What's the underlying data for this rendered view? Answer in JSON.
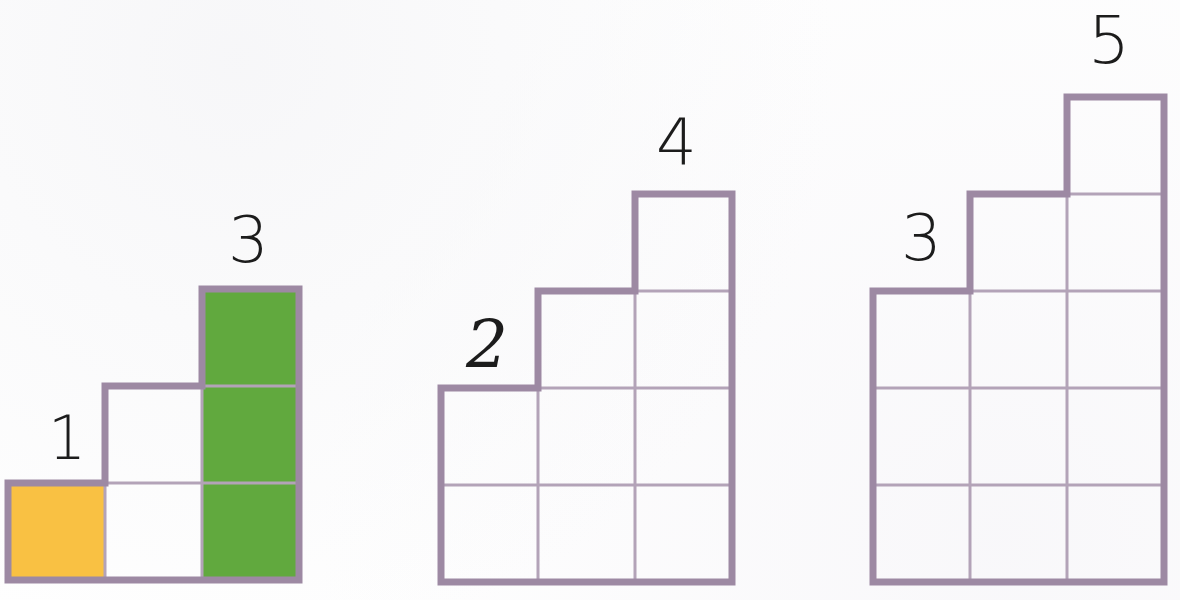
{
  "page": {
    "width": 1180,
    "height": 600,
    "background_color": "#fefefe"
  },
  "style": {
    "grid_line_color": "#a18fa6",
    "grid_outer_line_color": "#9d89a3",
    "grid_inner_line_color": "#b3a3b8",
    "fill_green": "#61a93e",
    "fill_orange": "#f9c143",
    "fill_white": "#ffffff",
    "label_color": "#1c1c1c",
    "cell_size_px": 97,
    "outer_stroke_px": 7,
    "inner_stroke_px": 3
  },
  "chart_data": {
    "type": "bar",
    "xlabel": "",
    "ylabel": "Number of squares in column",
    "ylim": [
      0,
      5
    ],
    "grid": true,
    "legend": "none",
    "note": "Three staircase patterns drawn as unit-square grids; each labelled column shows its height in squares.",
    "series": [
      {
        "name": "Figure 1",
        "categories": [
          "col-1",
          "col-2",
          "col-3"
        ],
        "values": [
          1,
          2,
          3
        ],
        "labels": [
          "1",
          "",
          "3"
        ],
        "total_squares": 6
      },
      {
        "name": "Figure 2",
        "categories": [
          "col-1",
          "col-2",
          "col-3"
        ],
        "values": [
          2,
          3,
          4
        ],
        "labels": [
          "2",
          "",
          "4"
        ],
        "total_squares": 9
      },
      {
        "name": "Figure 3",
        "categories": [
          "col-1",
          "col-2",
          "col-3"
        ],
        "values": [
          3,
          4,
          5
        ],
        "labels": [
          "3",
          "",
          "5"
        ],
        "total_squares": 12
      }
    ]
  },
  "figures": [
    {
      "id": "figure-1",
      "columns": [
        1,
        2,
        3
      ],
      "origin_x": 8,
      "baseline_y": 580,
      "labels": [
        {
          "text": "1",
          "x": 48,
          "y": 408,
          "size": 60,
          "style": "plain"
        },
        {
          "text": "3",
          "x": 228,
          "y": 208,
          "size": 64,
          "style": "plain"
        }
      ],
      "fills": [
        {
          "col": 0,
          "row": 0,
          "color": "#f9c143",
          "name": "orange-cell"
        },
        {
          "col": 2,
          "row": 0,
          "color": "#61a93e",
          "name": "green-cell"
        },
        {
          "col": 2,
          "row": 1,
          "color": "#61a93e",
          "name": "green-cell"
        },
        {
          "col": 2,
          "row": 2,
          "color": "#61a93e",
          "name": "green-cell"
        }
      ]
    },
    {
      "id": "figure-2",
      "columns": [
        2,
        3,
        4
      ],
      "origin_x": 441,
      "baseline_y": 582,
      "labels": [
        {
          "text": "2",
          "x": 466,
          "y": 312,
          "size": 66,
          "style": "script"
        },
        {
          "text": "4",
          "x": 656,
          "y": 110,
          "size": 64,
          "style": "plain"
        }
      ],
      "fills": []
    },
    {
      "id": "figure-3",
      "columns": [
        3,
        4,
        5
      ],
      "origin_x": 873,
      "baseline_y": 582,
      "labels": [
        {
          "text": "3",
          "x": 901,
          "y": 206,
          "size": 64,
          "style": "plain"
        },
        {
          "text": "5",
          "x": 1088,
          "y": 8,
          "size": 66,
          "style": "plain"
        }
      ],
      "fills": []
    }
  ]
}
